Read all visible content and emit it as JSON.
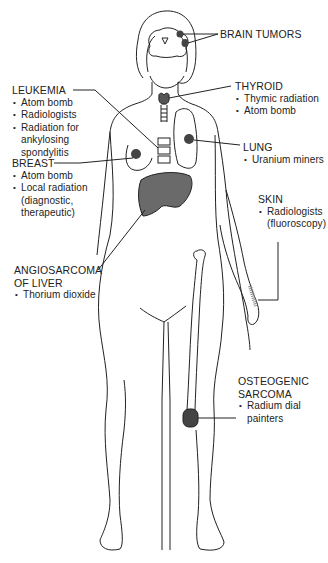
{
  "diagram": {
    "colors": {
      "line": "#222222",
      "lesion": "#555555",
      "liver": "#6a6a6a",
      "background": "#ffffff"
    },
    "labels": {
      "brain": {
        "title": "BRAIN TUMORS",
        "causes": []
      },
      "thyroid": {
        "title": "THYROID",
        "causes": [
          "Thymic radiation",
          "Atom bomb"
        ]
      },
      "leukemia": {
        "title": "LEUKEMIA",
        "causes": [
          "Atom bomb",
          "Radiologists",
          "Radiation for",
          "ankylosing",
          "spondylitis"
        ]
      },
      "lung": {
        "title": "LUNG",
        "causes": [
          "Uranium miners"
        ]
      },
      "breast": {
        "title": "BREAST",
        "causes": [
          "Atom bomb",
          "Local radiation",
          "(diagnostic,",
          "therapeutic)"
        ]
      },
      "skin": {
        "title": "SKIN",
        "causes": [
          "Radiologists",
          "(fluoroscopy)"
        ]
      },
      "liver": {
        "title_line1": "ANGIOSARCOMA",
        "title_line2": "OF LIVER",
        "causes": [
          "Thorium dioxide"
        ]
      },
      "bone": {
        "title_line1": "OSTEOGENIC",
        "title_line2": "SARCOMA",
        "causes": [
          "Radium dial",
          "painters"
        ]
      }
    }
  }
}
